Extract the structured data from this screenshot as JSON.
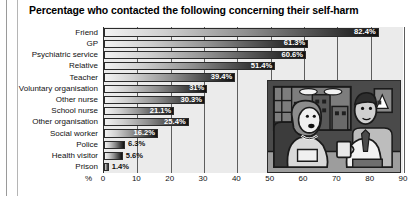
{
  "chart_data": {
    "type": "bar",
    "orientation": "horizontal",
    "title": "Percentage who contacted the following concerning their self-harm",
    "xlabel": "%",
    "ylabel": "",
    "xlim": [
      0,
      90
    ],
    "xticks": [
      0,
      10,
      20,
      30,
      40,
      50,
      60,
      70,
      80,
      90
    ],
    "grid": true,
    "legend": "none",
    "axis_unit_prefix": "%",
    "categories": [
      "Friend",
      "GP",
      "Psychiatric service",
      "Relative",
      "Teacher",
      "Voluntary organisation",
      "Other nurse",
      "School nurse",
      "Other organisation",
      "Social worker",
      "Police",
      "Health visitor",
      "Prison"
    ],
    "values": [
      82.4,
      61.3,
      60.6,
      51.4,
      39.4,
      31,
      30.3,
      21.1,
      25.4,
      16.2,
      6.3,
      5.6,
      1.4
    ],
    "data_labels": [
      "82.4%",
      "61.3%",
      "60.6%",
      "51.4%",
      "39.4%",
      "31%",
      "30.3%",
      "21.1%",
      "25.4%",
      "16.2%",
      "6.3%",
      "5.6%",
      "1.4%"
    ],
    "label_placement": [
      "inside",
      "inside",
      "inside",
      "inside",
      "inside",
      "inside",
      "inside",
      "inside",
      "inside",
      "inside",
      "outside",
      "outside",
      "outside"
    ],
    "colors": {
      "bar_gradient_start": "#f2f2f2",
      "bar_gradient_end": "#111111",
      "bar_border": "#2b2b2b",
      "plot_background": "#ebebeb",
      "gridline": "#5d5d5d",
      "text": "#111111",
      "label_inside": "#ffffff"
    }
  },
  "illustration": {
    "name": "two-people-talking-cartoon",
    "description": "Cartoon of a woman seated in an armchair talking with a man holding a mug, window with city buildings behind"
  }
}
